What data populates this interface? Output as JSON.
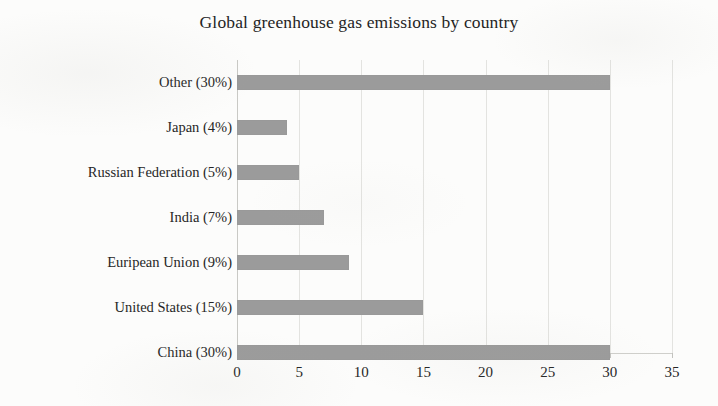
{
  "chart_data": {
    "type": "bar",
    "orientation": "horizontal",
    "title": "Global greenhouse gas emissions  by country",
    "xlabel": "",
    "ylabel": "",
    "xlim": [
      0,
      35
    ],
    "xticks": [
      0,
      5,
      10,
      15,
      20,
      25,
      30,
      35
    ],
    "xtick_labels": [
      "0",
      "5",
      "10",
      "15",
      "20",
      "25",
      "30",
      "35"
    ],
    "grid": true,
    "legend": false,
    "bar_color": "#9b9b9b",
    "categories": [
      "Other (30%)",
      "Japan (4%)",
      "Russian Federation (5%)",
      "India (7%)",
      "Euripean Union (9%)",
      "United States (15%)",
      "China (30%)"
    ],
    "values": [
      30,
      4,
      5,
      7,
      9,
      15,
      30
    ],
    "series": [
      {
        "name": "Share of global greenhouse gas emissions",
        "values": [
          30,
          4,
          5,
          7,
          9,
          15,
          30
        ]
      }
    ],
    "points": [
      {
        "category": "Other (30%)",
        "value": 30,
        "percent": "30%"
      },
      {
        "category": "Japan (4%)",
        "value": 4,
        "percent": "4%"
      },
      {
        "category": "Russian Federation (5%)",
        "value": 5,
        "percent": "5%"
      },
      {
        "category": "India (7%)",
        "value": 7,
        "percent": "7%"
      },
      {
        "category": "Euripean Union (9%)",
        "value": 9,
        "percent": "9%"
      },
      {
        "category": "United States (15%)",
        "value": 15,
        "percent": "15%"
      },
      {
        "category": "China (30%)",
        "value": 30,
        "percent": "30%"
      }
    ]
  }
}
